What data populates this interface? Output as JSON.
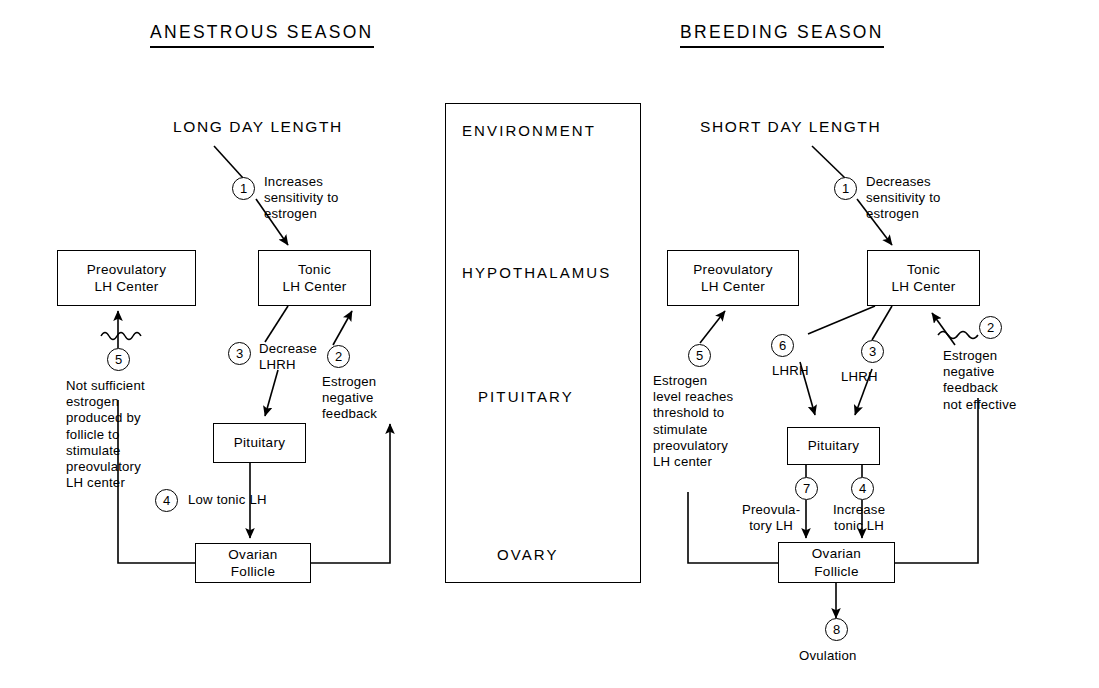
{
  "figure": {
    "type": "flow-diagram",
    "titles": {
      "left": "ANESTROUS SEASON",
      "right": "BREEDING SEASON"
    }
  },
  "center_column": {
    "levels": [
      "ENVIRONMENT",
      "HYPOTHALAMUS",
      "PITUITARY",
      "OVARY"
    ]
  },
  "left_panel": {
    "stimulus": "LONG DAY LENGTH",
    "boxes": {
      "preovulatory": "Preovulatory\nLH Center",
      "tonic": "Tonic\nLH Center",
      "pituitary": "Pituitary",
      "follicle": "Ovarian\nFollicle"
    },
    "steps": [
      {
        "n": "1",
        "label": "Increases\nsensitivity to\nestrogen"
      },
      {
        "n": "2",
        "label": "Estrogen\nnegative\nfeedback"
      },
      {
        "n": "3",
        "label": "Decrease\nLHRH"
      },
      {
        "n": "4",
        "label": "Low tonic LH"
      },
      {
        "n": "5",
        "label": "Not sufficient\nestrogen\nproduced by\nfollicle to\nstimulate\npreovulatory\nLH center"
      }
    ]
  },
  "right_panel": {
    "stimulus": "SHORT DAY LENGTH",
    "boxes": {
      "preovulatory": "Preovulatory\nLH Center",
      "tonic": "Tonic\nLH Center",
      "pituitary": "Pituitary",
      "follicle": "Ovarian\nFollicle"
    },
    "steps": [
      {
        "n": "1",
        "label": "Decreases\nsensitivity to\nestrogen"
      },
      {
        "n": "2",
        "label": "Estrogen\nnegative\nfeedback\nnot effective"
      },
      {
        "n": "3",
        "label": "LHRH"
      },
      {
        "n": "4",
        "label": "Increase\ntonic LH"
      },
      {
        "n": "5",
        "label": "Estrogen\nlevel reaches\nthreshold to\nstimulate\npreovulatory\nLH center"
      },
      {
        "n": "6",
        "label": "LHRH"
      },
      {
        "n": "7",
        "label": "Preovula-\ntory LH"
      },
      {
        "n": "8",
        "label": "Ovulation"
      }
    ]
  }
}
